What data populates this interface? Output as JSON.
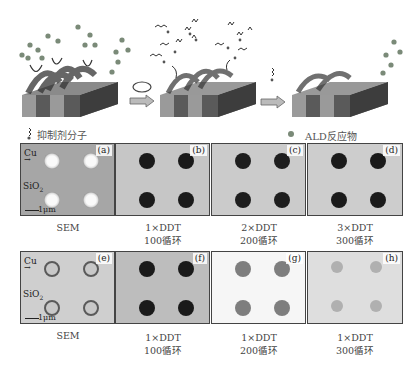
{
  "legend": {
    "inhibitor_label": "抑制剂分子",
    "reactant_label": "ALD反应物"
  },
  "schematic": {
    "stages": [
      {
        "name": "stage-1",
        "description": "inhibitor-covered Cu lines, ALD reactants repelled"
      },
      {
        "name": "stage-2",
        "description": "inhibitor re-dosing cycle"
      },
      {
        "name": "stage-3",
        "description": "selective deposition on dielectric"
      }
    ],
    "substrate_labels": [
      "Cu",
      "SiO2",
      "Cu",
      "SiO2"
    ],
    "arrows": [
      "cycle-arrow",
      "right-arrow",
      "right-arrow"
    ]
  },
  "colors": {
    "sem_top_bg": "#a8a8a8",
    "sem_bottom_bg": "#c8c8c8",
    "map_bg": "#c9c9c9",
    "dark_dot": "#1a1a1a",
    "faint_dot": "#8a8a8a",
    "reactant": "#7a8a78"
  },
  "rows": [
    {
      "panels": [
        {
          "label": "(a)",
          "type": "sem",
          "cu_label": "Cu",
          "sio2_label": "SiO",
          "sio2_sub": "2",
          "scale_label": "1μm"
        },
        {
          "label": "(b)",
          "type": "map"
        },
        {
          "label": "(c)",
          "type": "map"
        },
        {
          "label": "(d)",
          "type": "map"
        }
      ],
      "captions": [
        {
          "line1": "SEM",
          "line2": ""
        },
        {
          "line1": "1×DDT",
          "line2": "100循环"
        },
        {
          "line1": "2×DDT",
          "line2": "200循环"
        },
        {
          "line1": "3×DDT",
          "line2": "300循环"
        }
      ]
    },
    {
      "panels": [
        {
          "label": "(e)",
          "type": "sem",
          "cu_label": "Cu",
          "sio2_label": "SiO",
          "sio2_sub": "2",
          "scale_label": "1μm"
        },
        {
          "label": "(f)",
          "type": "map"
        },
        {
          "label": "(g)",
          "type": "map"
        },
        {
          "label": "(h)",
          "type": "map"
        }
      ],
      "captions": [
        {
          "line1": "SEM",
          "line2": ""
        },
        {
          "line1": "1×DDT",
          "line2": "100循环"
        },
        {
          "line1": "1×DDT",
          "line2": "200循环"
        },
        {
          "line1": "1×DDT",
          "line2": "300循环"
        }
      ]
    }
  ]
}
